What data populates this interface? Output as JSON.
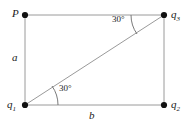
{
  "figure": {
    "type": "geometry-diagram",
    "background_color": "#ffffff",
    "line_color": "#9a9a9a",
    "dot_color": "#111111",
    "text_color": "#1a1a1a",
    "vertices": [
      {
        "id": "P",
        "label": "P",
        "subscript": "",
        "x": 25,
        "y": 15,
        "has_dot": true
      },
      {
        "id": "q3",
        "label": "q",
        "subscript": "3",
        "x": 164,
        "y": 15,
        "has_dot": true
      },
      {
        "id": "q1",
        "label": "q",
        "subscript": "1",
        "x": 25,
        "y": 105,
        "has_dot": true
      },
      {
        "id": "q2",
        "label": "q",
        "subscript": "2",
        "x": 164,
        "y": 105,
        "has_dot": true
      }
    ],
    "sides": [
      {
        "id": "left",
        "label": "a",
        "from": "P",
        "to": "q1"
      },
      {
        "id": "bottom",
        "label": "b",
        "from": "q1",
        "to": "q2"
      },
      {
        "id": "top",
        "label": "",
        "from": "P",
        "to": "q3"
      },
      {
        "id": "right",
        "label": "",
        "from": "q3",
        "to": "q2"
      }
    ],
    "diagonal": {
      "from": "q1",
      "to": "q3"
    },
    "angles": [
      {
        "id": "angle-at-q1",
        "value": "30",
        "unit": "°",
        "text": "30°",
        "at": "q1",
        "between": [
          "bottom",
          "diagonal"
        ]
      },
      {
        "id": "angle-at-q3",
        "value": "30",
        "unit": "°",
        "text": "30°",
        "at": "q3",
        "between": [
          "top",
          "diagonal"
        ]
      }
    ]
  }
}
